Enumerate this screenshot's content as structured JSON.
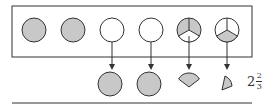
{
  "diagram": {
    "colors": {
      "fill": "#c8c8c8",
      "stroke": "#333333",
      "background": "#ffffff"
    },
    "top_row": [
      {
        "id": "circle-1",
        "type": "full",
        "shaded": true
      },
      {
        "id": "circle-2",
        "type": "full",
        "shaded": true
      },
      {
        "id": "circle-3",
        "type": "full",
        "shaded": false
      },
      {
        "id": "circle-4",
        "type": "full",
        "shaded": false
      },
      {
        "id": "circle-5",
        "type": "thirds",
        "shaded_thirds": 2
      },
      {
        "id": "circle-6",
        "type": "thirds",
        "shaded_thirds": 1
      }
    ],
    "bottom_row": [
      {
        "id": "result-1",
        "type": "full-circle"
      },
      {
        "id": "result-2",
        "type": "full-circle"
      },
      {
        "id": "result-3",
        "type": "third-sector"
      },
      {
        "id": "result-4",
        "type": "third-sector"
      }
    ],
    "result": {
      "whole": "2",
      "numerator": "2",
      "denominator": "3"
    }
  }
}
